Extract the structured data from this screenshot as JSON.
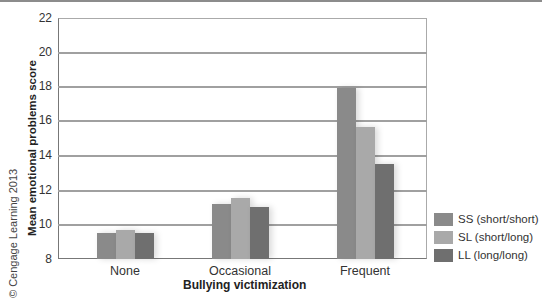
{
  "copyright": "© Cengage Learning 2013",
  "chart_data": {
    "type": "bar",
    "title": "",
    "xlabel": "Bullying victimization",
    "ylabel": "Mean emotional problems score",
    "ylim": [
      8,
      22
    ],
    "yticks": [
      8,
      10,
      12,
      14,
      16,
      18,
      20,
      22
    ],
    "grid": true,
    "legend_position": "right-bottom",
    "categories": [
      "None",
      "Occasional",
      "Frequent"
    ],
    "series": [
      {
        "name": "SS (short/short)",
        "color": "#8a8a8a",
        "values": [
          9.5,
          11.2,
          17.95
        ]
      },
      {
        "name": "SL (short/long)",
        "color": "#a9a9a9",
        "values": [
          9.7,
          11.55,
          15.65
        ]
      },
      {
        "name": "LL (long/long)",
        "color": "#6f6f6f",
        "values": [
          9.5,
          11.0,
          13.5
        ]
      }
    ]
  },
  "ticks": {
    "t0": "8",
    "t1": "10",
    "t2": "12",
    "t3": "14",
    "t4": "16",
    "t5": "18",
    "t6": "20",
    "t7": "22"
  },
  "legend": {
    "ss": "SS (short/short)",
    "sl": "SL (short/long)",
    "ll": "LL (long/long)"
  },
  "xaxis": {
    "c0": "None",
    "c1": "Occasional",
    "c2": "Frequent"
  }
}
